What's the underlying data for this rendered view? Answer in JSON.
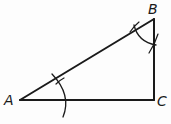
{
  "diagram": {
    "vertices": [
      {
        "label": "A",
        "x": 20,
        "y": 100
      },
      {
        "label": "B",
        "x": 154,
        "y": 19
      },
      {
        "label": "C",
        "x": 154,
        "y": 100
      }
    ],
    "labels": {
      "a": "A",
      "b": "B",
      "c": "C"
    },
    "stroke_color": "#1a1a1a"
  }
}
